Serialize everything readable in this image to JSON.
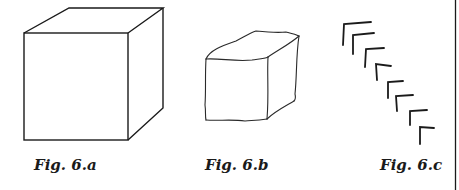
{
  "figures": [
    {
      "id": "6a",
      "caption": "Fig. 6.a",
      "description": "Precise cube drawing"
    },
    {
      "id": "6b",
      "caption": "Fig. 6.b",
      "description": "Freehand sketched cube"
    },
    {
      "id": "6c",
      "caption": "Fig. 6.c",
      "description": "Series of corner strokes descending diagonally"
    }
  ],
  "colors": {
    "ink": "#1a1a1a",
    "background": "#ffffff"
  }
}
